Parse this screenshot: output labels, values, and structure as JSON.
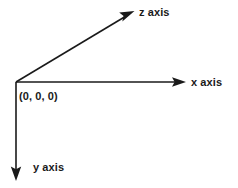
{
  "diagram": {
    "background_color": "#ffffff",
    "stroke_color": "#1a1a1a",
    "text_color": "#1a1a1a",
    "origin": {
      "x": 16,
      "y": 82
    },
    "labels": {
      "x_axis": "x axis",
      "y_axis": "y axis",
      "z_axis": "z axis",
      "origin": "(0, 0, 0)"
    },
    "axes": [
      {
        "name": "x",
        "label": "x axis",
        "direction": "right",
        "start": {
          "x": 16,
          "y": 82
        },
        "end": {
          "x": 185,
          "y": 82
        },
        "arrowhead": "end"
      },
      {
        "name": "y",
        "label": "y axis",
        "direction": "down",
        "start": {
          "x": 16,
          "y": 82
        },
        "end": {
          "x": 16,
          "y": 180
        },
        "arrowhead": "end"
      },
      {
        "name": "z",
        "label": "z axis",
        "direction": "up-right",
        "start": {
          "x": 16,
          "y": 82
        },
        "end": {
          "x": 133,
          "y": 12
        },
        "arrowhead": "end"
      }
    ]
  }
}
